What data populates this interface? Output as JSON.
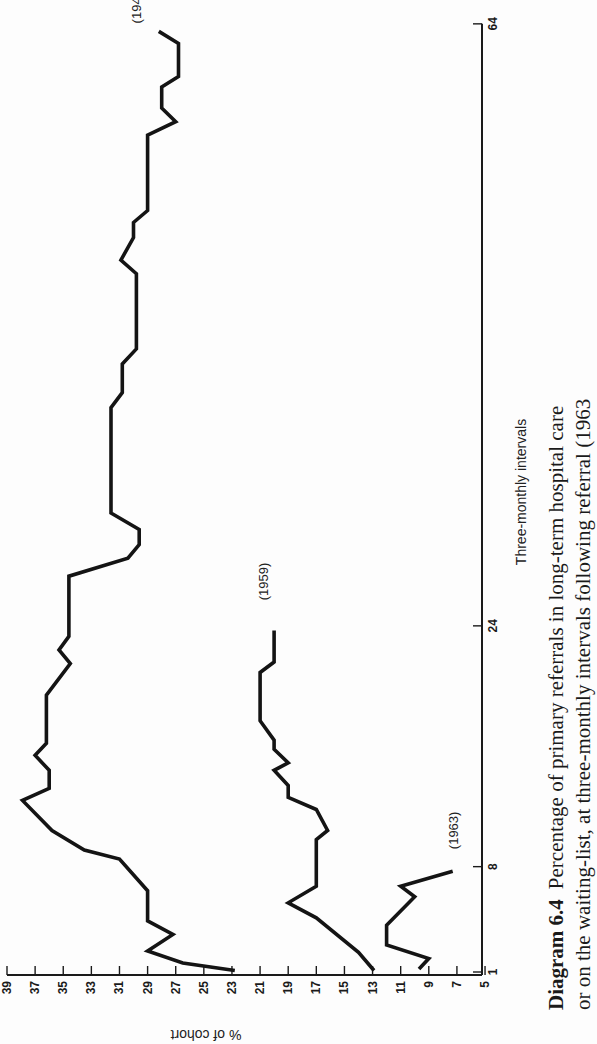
{
  "chart_data": {
    "type": "line",
    "orientation": "rotated 90deg counter-clockwise (x-axis runs bottom-to-top along right side, y-axis runs along bottom edge reading right-to-left)",
    "caption": {
      "line1_bold": "Diagram 6.4",
      "line1_rest": "Percentage of primary referrals in long-term hospital care",
      "line2": "or on the waiting-list, at three-monthly intervals following referral (1963"
    },
    "xlabel": "Three-monthly intervals",
    "ylabel": "% of cohort",
    "xlim": [
      1,
      64
    ],
    "ylim": [
      5,
      39
    ],
    "x_ticks": [
      1,
      8,
      24,
      64
    ],
    "x_tick_labels": [
      "1",
      "8",
      "24",
      "64"
    ],
    "y_ticks": [
      39,
      37,
      35,
      33,
      31,
      29,
      27,
      25,
      23,
      21,
      19,
      17,
      15,
      13,
      11,
      9,
      7,
      5
    ],
    "y_tick_labels": [
      "39",
      "37",
      "35",
      "33",
      "31",
      "29",
      "27",
      "25",
      "23",
      "21",
      "19",
      "17",
      "15",
      "13",
      "11",
      "9",
      "7",
      "5"
    ],
    "grid": false,
    "legend": "inline labels at series ends",
    "series": [
      {
        "name": "(1949)",
        "points": [
          [
            1.1,
            22.8
          ],
          [
            1.6,
            26.5
          ],
          [
            2.4,
            29.0
          ],
          [
            3.5,
            27.2
          ],
          [
            4.4,
            29.0
          ],
          [
            6.4,
            29.0
          ],
          [
            8.5,
            31.0
          ],
          [
            9.1,
            33.5
          ],
          [
            10.4,
            35.8
          ],
          [
            12.4,
            37.9
          ],
          [
            13.2,
            36.0
          ],
          [
            14.4,
            36.0
          ],
          [
            15.4,
            37.0
          ],
          [
            16.2,
            36.2
          ],
          [
            19.4,
            36.2
          ],
          [
            21.5,
            34.5
          ],
          [
            22.4,
            35.3
          ],
          [
            23.3,
            34.6
          ],
          [
            27.3,
            34.6
          ],
          [
            28.5,
            30.4
          ],
          [
            29.4,
            29.6
          ],
          [
            30.4,
            29.6
          ],
          [
            31.5,
            31.6
          ],
          [
            38.5,
            31.6
          ],
          [
            39.5,
            30.8
          ],
          [
            41.4,
            30.8
          ],
          [
            42.4,
            29.8
          ],
          [
            47.4,
            29.8
          ],
          [
            48.3,
            30.9
          ],
          [
            49.8,
            30.0
          ],
          [
            50.8,
            30.0
          ],
          [
            51.6,
            29.0
          ],
          [
            56.6,
            29.0
          ],
          [
            57.5,
            27.0
          ],
          [
            58.4,
            28.0
          ],
          [
            59.8,
            28.0
          ],
          [
            60.5,
            26.8
          ],
          [
            62.7,
            26.8
          ],
          [
            63.5,
            28.2
          ]
        ],
        "label_at": [
          63.5,
          28.2
        ]
      },
      {
        "name": "(1959)",
        "points": [
          [
            1.1,
            12.9
          ],
          [
            2.3,
            14.0
          ],
          [
            4.6,
            17.0
          ],
          [
            5.6,
            19.0
          ],
          [
            6.7,
            17.0
          ],
          [
            9.8,
            17.0
          ],
          [
            10.4,
            16.2
          ],
          [
            11.8,
            17.0
          ],
          [
            12.6,
            19.0
          ],
          [
            13.4,
            19.0
          ],
          [
            14.4,
            20.0
          ],
          [
            14.9,
            19.0
          ],
          [
            15.8,
            20.0
          ],
          [
            16.4,
            20.0
          ],
          [
            17.7,
            21.0
          ],
          [
            20.9,
            21.0
          ],
          [
            21.6,
            20.0
          ],
          [
            23.7,
            20.0
          ]
        ],
        "label_at": [
          23.7,
          20.0
        ]
      },
      {
        "name": "(1963)",
        "points": [
          [
            1.2,
            9.7
          ],
          [
            1.9,
            9.0
          ],
          [
            2.8,
            12.0
          ],
          [
            4.1,
            12.0
          ],
          [
            6.0,
            10.0
          ],
          [
            6.7,
            11.0
          ],
          [
            7.7,
            7.3
          ]
        ],
        "label_at": [
          7.7,
          7.3
        ]
      }
    ]
  },
  "layout": {
    "x_origin_px": 972,
    "px_per_interval": 15.05,
    "y_origin_px": 7,
    "px_per_percent": 14.06,
    "axis_line_x": 482,
    "axis_line_y": 975
  }
}
